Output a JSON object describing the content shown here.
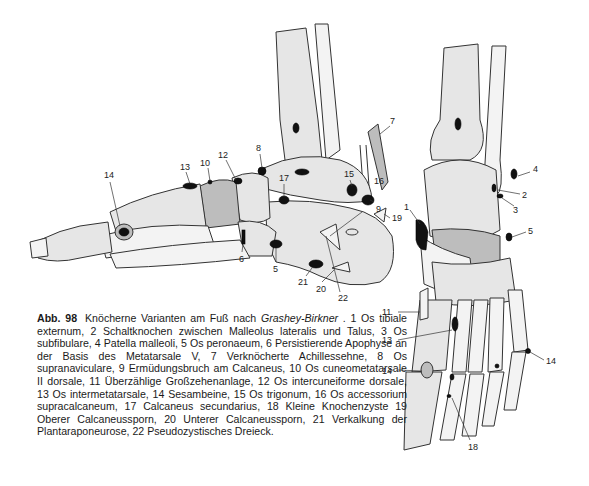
{
  "figure": {
    "number": "Abb. 98",
    "title_prefix": "Knöcherne Varianten am Fuß nach ",
    "title_author": "Grashey-Birkner",
    "title_suffix": " .",
    "caption_body": "1 Os tibiale externum, 2 Schaltknochen zwischen Malleolus lateralis und Talus, 3 Os subfibulare, 4 Patella malleoli, 5 Os peronaeum, 6 Persistierende Apophyse an der Basis des Metatarsale V, 7 Verknöcherte Achillessehne, 8 Os supranaviculare, 9 Ermüdungsbruch am Calcaneus, 10 Os cuneometatarsale II dorsale, 11 Überzählige Großzehenanlage, 12 Os intercuneiforme dorsale, 13 Os intermetatarsale, 14 Sesambeine, 15 Os trigonum, 16 Os accessorium supracalcaneum, 17 Calcaneus secundarius, 18 Kleine Knochenzyste 19 Oberer Calcaneussporn, 20 Unterer Calcaneussporn, 21 Verkalkung der Plantaraponeurose, 22 Pseudozystisches Dreieck."
  },
  "legend": [
    {
      "n": "1",
      "text": "Os tibiale externum"
    },
    {
      "n": "2",
      "text": "Schaltknochen zwischen Malleolus lateralis und Talus"
    },
    {
      "n": "3",
      "text": "Os subfibulare"
    },
    {
      "n": "4",
      "text": "Patella malleoli"
    },
    {
      "n": "5",
      "text": "Os peronaeum"
    },
    {
      "n": "6",
      "text": "Persistierende Apophyse an der Basis des Metatarsale V"
    },
    {
      "n": "7",
      "text": "Verknöcherte Achillessehne"
    },
    {
      "n": "8",
      "text": "Os supranaviculare"
    },
    {
      "n": "9",
      "text": "Ermüdungsbruch am Calcaneus"
    },
    {
      "n": "10",
      "text": "Os cuneometatarsale II dorsale"
    },
    {
      "n": "11",
      "text": "Überzählige Großzehenanlage"
    },
    {
      "n": "12",
      "text": "Os intercuneiforme dorsale"
    },
    {
      "n": "13",
      "text": "Os intermetatarsale"
    },
    {
      "n": "14",
      "text": "Sesambeine"
    },
    {
      "n": "15",
      "text": "Os trigonum"
    },
    {
      "n": "16",
      "text": "Os accessorium supracalcaneum"
    },
    {
      "n": "17",
      "text": "Calcaneus secundarius"
    },
    {
      "n": "18",
      "text": "Kleine Knochenzyste"
    },
    {
      "n": "19",
      "text": "Oberer Calcaneussporn"
    },
    {
      "n": "20",
      "text": "Unterer Calcaneussporn"
    },
    {
      "n": "21",
      "text": "Verkalkung der Plantaraponeurose"
    },
    {
      "n": "22",
      "text": "Pseudozystisches Dreieck"
    }
  ],
  "labels": {
    "lateral": {
      "l14": "14",
      "l13": "13",
      "l10": "10",
      "l12": "12",
      "l8": "8",
      "l17": "17",
      "l7": "7",
      "l15": "15",
      "l16": "16",
      "l9": "9",
      "l19": "19",
      "l6": "6",
      "l5": "5",
      "l21": "21",
      "l20": "20",
      "l22": "22"
    },
    "dorsal": {
      "l4": "4",
      "l2": "2",
      "l3": "3",
      "l1": "1",
      "l5": "5",
      "l11": "11",
      "l13": "13",
      "l14a": "14",
      "l14b": "14",
      "l18": "18"
    }
  }
}
